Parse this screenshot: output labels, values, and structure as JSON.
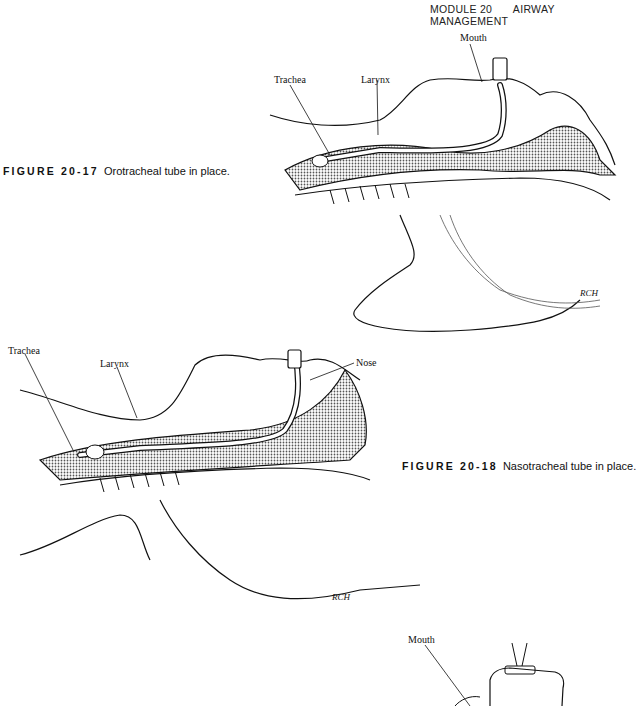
{
  "header": {
    "module": "MODULE 20",
    "section": "AIRWAY MANAGEMENT"
  },
  "figures": [
    {
      "number": "FIGURE 20-17",
      "caption": "Orotracheal tube in place.",
      "labels": {
        "mouth": "Mouth",
        "trachea": "Trachea",
        "larynx": "Larynx"
      },
      "signature": "RCH"
    },
    {
      "number": "FIGURE 20-18",
      "caption": "Nasotracheal tube in place.",
      "labels": {
        "trachea": "Trachea",
        "larynx": "Larynx",
        "nose": "Nose"
      },
      "signature": "RCH"
    },
    {
      "labels": {
        "mouth": "Mouth"
      }
    }
  ],
  "colors": {
    "ink": "#111111",
    "shade": "#9a9a9a",
    "paper": "#ffffff"
  }
}
